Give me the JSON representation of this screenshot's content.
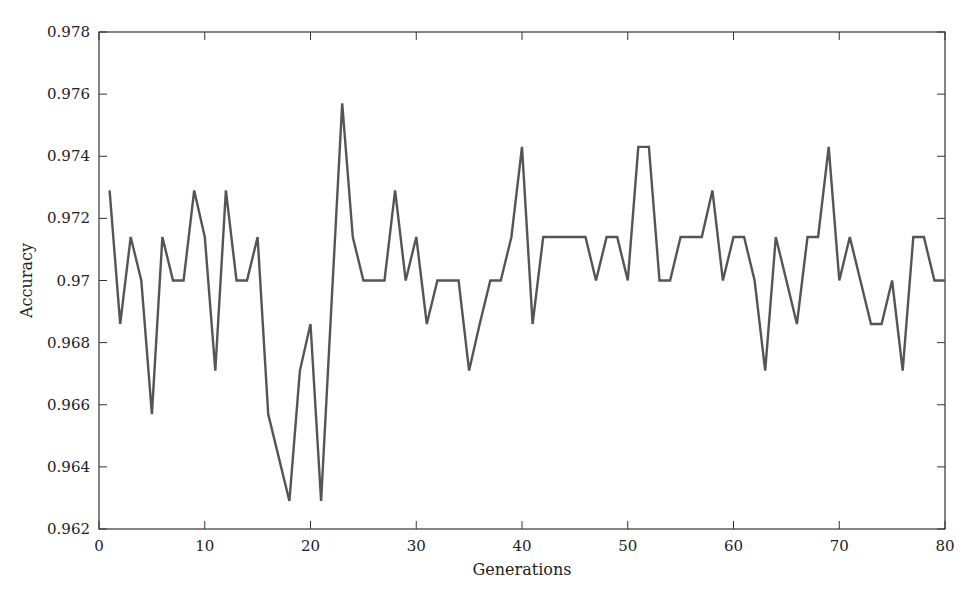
{
  "chart_data": {
    "type": "line",
    "title": "",
    "xlabel": "Generations",
    "ylabel": "Accuracy",
    "xlim": [
      0,
      80
    ],
    "ylim": [
      0.962,
      0.978
    ],
    "x_ticks": [
      0,
      10,
      20,
      30,
      40,
      50,
      60,
      70,
      80
    ],
    "y_ticks": [
      0.962,
      0.964,
      0.966,
      0.968,
      0.97,
      0.972,
      0.974,
      0.976,
      0.978
    ],
    "y_tick_labels": [
      "0.962",
      "0.964",
      "0.966",
      "0.968",
      "0.97",
      "0.972",
      "0.974",
      "0.976",
      "0.978"
    ],
    "grid": false,
    "legend": null,
    "line_color": "#555555",
    "series": [
      {
        "name": "Accuracy",
        "x": [
          1,
          2,
          3,
          4,
          5,
          6,
          7,
          8,
          9,
          10,
          11,
          12,
          13,
          14,
          15,
          16,
          17,
          18,
          19,
          20,
          21,
          22,
          23,
          24,
          25,
          26,
          27,
          28,
          29,
          30,
          31,
          32,
          33,
          34,
          35,
          36,
          37,
          38,
          39,
          40,
          41,
          42,
          43,
          44,
          45,
          46,
          47,
          48,
          49,
          50,
          51,
          52,
          53,
          54,
          55,
          56,
          57,
          58,
          59,
          60,
          61,
          62,
          63,
          64,
          65,
          66,
          67,
          68,
          69,
          70,
          71,
          72,
          73,
          74,
          75,
          76,
          77,
          78,
          79,
          80
        ],
        "values": [
          0.9729,
          0.9686,
          0.9714,
          0.97,
          0.9657,
          0.9714,
          0.97,
          0.97,
          0.9729,
          0.9714,
          0.9671,
          0.9729,
          0.97,
          0.97,
          0.9714,
          0.9657,
          0.9643,
          0.9629,
          0.9671,
          0.9686,
          0.9629,
          0.9693,
          0.9757,
          0.9714,
          0.97,
          0.97,
          0.97,
          0.9729,
          0.97,
          0.9714,
          0.9686,
          0.97,
          0.97,
          0.97,
          0.9671,
          0.9686,
          0.97,
          0.97,
          0.9714,
          0.9743,
          0.9686,
          0.9714,
          0.9714,
          0.9714,
          0.9714,
          0.9714,
          0.97,
          0.9714,
          0.9714,
          0.97,
          0.9743,
          0.9743,
          0.97,
          0.97,
          0.9714,
          0.9714,
          0.9714,
          0.9729,
          0.97,
          0.9714,
          0.9714,
          0.97,
          0.9671,
          0.9714,
          0.97,
          0.9686,
          0.9714,
          0.9714,
          0.9743,
          0.97,
          0.9714,
          0.97,
          0.9686,
          0.9686,
          0.97,
          0.9671,
          0.9714,
          0.9714,
          0.97,
          0.97
        ]
      }
    ]
  },
  "layout": {
    "plot_left": 99,
    "plot_right": 945,
    "plot_top": 32,
    "plot_bottom": 529
  }
}
